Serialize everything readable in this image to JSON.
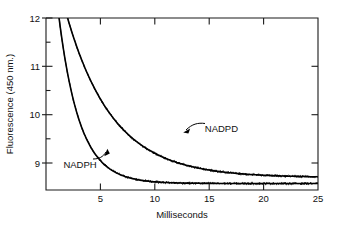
{
  "chart_data": {
    "type": "line",
    "title": "",
    "xlabel": "Milliseconds",
    "ylabel": "Fluorescence (450 nm.)",
    "xlim": [
      0,
      25
    ],
    "ylim": [
      8.55,
      12
    ],
    "grid": false,
    "legend_position": "inline-annotations",
    "x_ticks": [
      5,
      10,
      15,
      20,
      25
    ],
    "x_tick_labels": [
      "5",
      "10",
      "15",
      "20",
      "25"
    ],
    "y_ticks": [
      9,
      10,
      11,
      12
    ],
    "y_tick_labels": [
      "9",
      "10",
      "11",
      "12"
    ],
    "y_minor_ticks": [
      9.5,
      10.5,
      11.5
    ],
    "annotations": [
      {
        "text": "NADPD",
        "x": 14.6,
        "y": 9.72
      },
      {
        "text": "NADPH",
        "x": 1.6,
        "y": 9.0
      }
    ],
    "series": [
      {
        "name": "NADPH",
        "model": "single exponential decay",
        "amplitude": 6.2,
        "rate_per_ms": 0.52,
        "baseline": 8.68,
        "x": [
          0.4,
          0.8,
          1.2,
          1.6,
          2.0,
          2.5,
          3.0,
          3.5,
          4.0,
          4.5,
          5.0,
          5.5,
          6.0,
          7.0,
          8.0,
          9.0,
          10.0,
          11.0,
          12.0,
          13.0,
          14.0,
          15.0,
          16.0,
          17.0,
          18.0,
          19.0,
          20.0,
          21.0,
          22.0,
          23.0,
          24.0,
          25.0
        ],
        "y": [
          13.72,
          12.77,
          12.0,
          11.38,
          10.87,
          10.37,
          9.99,
          9.7,
          9.49,
          9.33,
          9.14,
          9.09,
          8.96,
          8.86,
          8.78,
          8.76,
          8.74,
          8.73,
          8.72,
          8.71,
          8.71,
          8.7,
          8.7,
          8.7,
          8.7,
          8.69,
          8.69,
          8.69,
          8.69,
          8.69,
          8.69,
          8.69
        ]
      },
      {
        "name": "NADPD",
        "model": "single exponential decay",
        "amplitude": 5.1,
        "rate_per_ms": 0.235,
        "baseline": 8.8,
        "x": [
          0.8,
          1.5,
          2.0,
          2.5,
          3.0,
          3.5,
          4.0,
          4.5,
          5.0,
          5.5,
          6.0,
          7.0,
          8.0,
          9.0,
          10.0,
          11.0,
          12.0,
          13.0,
          14.0,
          15.0,
          16.0,
          17.0,
          18.0,
          19.0,
          20.0,
          21.0,
          22.0,
          23.0,
          24.0,
          25.0
        ],
        "y": [
          13.03,
          12.39,
          12.0,
          11.63,
          11.32,
          11.03,
          10.79,
          10.57,
          10.37,
          10.19,
          10.04,
          9.78,
          9.58,
          9.42,
          9.29,
          9.19,
          9.11,
          9.05,
          9.0,
          8.96,
          8.93,
          8.91,
          8.89,
          8.88,
          8.87,
          8.86,
          8.86,
          8.85,
          8.85,
          8.85
        ]
      }
    ]
  },
  "figure": {
    "plot_left": 46,
    "plot_right": 318,
    "plot_top": 18,
    "plot_bottom": 190
  }
}
